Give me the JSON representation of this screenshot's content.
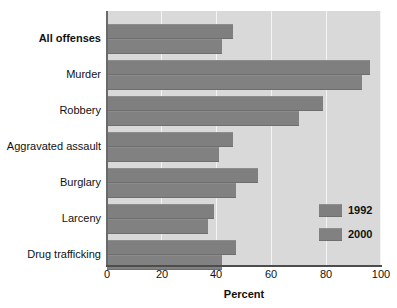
{
  "chart_data": {
    "type": "bar",
    "orientation": "horizontal",
    "title": "",
    "xlabel": "Percent",
    "ylabel": "",
    "xlim": [
      0,
      100
    ],
    "xticks": [
      0,
      20,
      40,
      60,
      80,
      100
    ],
    "xtick_labels": [
      "0",
      "20",
      "40",
      "60",
      "80",
      "100"
    ],
    "grid": "vertical",
    "legend_position": "lower-right",
    "categories": [
      "All offenses",
      "Murder",
      "Robbery",
      "Aggravated assault",
      "Burglary",
      "Larceny",
      "Drug trafficking"
    ],
    "series": [
      {
        "name": "1992",
        "color": "#7f7f7f",
        "values": [
          46,
          96,
          79,
          46,
          55,
          39,
          47
        ]
      },
      {
        "name": "2000",
        "color": "#818181",
        "values": [
          42,
          93,
          70,
          41,
          47,
          37,
          42
        ]
      }
    ]
  },
  "axis": {
    "x_title": "Percent"
  },
  "legend": {
    "items": [
      {
        "label": "1992"
      },
      {
        "label": "2000"
      }
    ]
  },
  "style": {
    "plot_background": "#d9d9d9",
    "gridline_color": "#f4f4f4",
    "bar_color": "#7f7f7f",
    "text_color": "#111111"
  }
}
